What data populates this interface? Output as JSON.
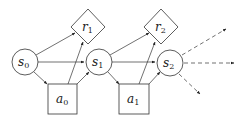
{
  "diagram": {
    "type": "influence-diagram",
    "nodes": [
      {
        "id": "s0",
        "shape": "circle",
        "base": "s",
        "sub": "0"
      },
      {
        "id": "s1",
        "shape": "circle",
        "base": "s",
        "sub": "1"
      },
      {
        "id": "s2",
        "shape": "circle",
        "base": "s",
        "sub": "2"
      },
      {
        "id": "a0",
        "shape": "square",
        "base": "a",
        "sub": "0"
      },
      {
        "id": "a1",
        "shape": "square",
        "base": "a",
        "sub": "1"
      },
      {
        "id": "r1",
        "shape": "diamond",
        "base": "r",
        "sub": "1"
      },
      {
        "id": "r2",
        "shape": "diamond",
        "base": "r",
        "sub": "2"
      }
    ],
    "edges": [
      {
        "from": "s0",
        "to": "r1",
        "style": "solid"
      },
      {
        "from": "s0",
        "to": "s1",
        "style": "solid"
      },
      {
        "from": "s0",
        "to": "a0",
        "style": "solid"
      },
      {
        "from": "a0",
        "to": "r1",
        "style": "solid"
      },
      {
        "from": "a0",
        "to": "s1",
        "style": "solid"
      },
      {
        "from": "s1",
        "to": "r2",
        "style": "solid"
      },
      {
        "from": "s1",
        "to": "s2",
        "style": "solid"
      },
      {
        "from": "s1",
        "to": "a1",
        "style": "solid"
      },
      {
        "from": "a1",
        "to": "r2",
        "style": "solid"
      },
      {
        "from": "a1",
        "to": "s2",
        "style": "solid"
      },
      {
        "from": "s2",
        "to": "out-up",
        "style": "dashed"
      },
      {
        "from": "s2",
        "to": "out-right",
        "style": "dashed"
      },
      {
        "from": "s2",
        "to": "out-down",
        "style": "dashed"
      }
    ]
  },
  "labels": {
    "s0": {
      "base": "s",
      "sub": "0"
    },
    "s1": {
      "base": "s",
      "sub": "1"
    },
    "s2": {
      "base": "s",
      "sub": "2"
    },
    "a0": {
      "base": "a",
      "sub": "0"
    },
    "a1": {
      "base": "a",
      "sub": "1"
    },
    "r1": {
      "base": "r",
      "sub": "1"
    },
    "r2": {
      "base": "r",
      "sub": "2"
    }
  },
  "colors": {
    "stroke": "#333333",
    "fill": "#ffffff",
    "text": "#222222"
  }
}
